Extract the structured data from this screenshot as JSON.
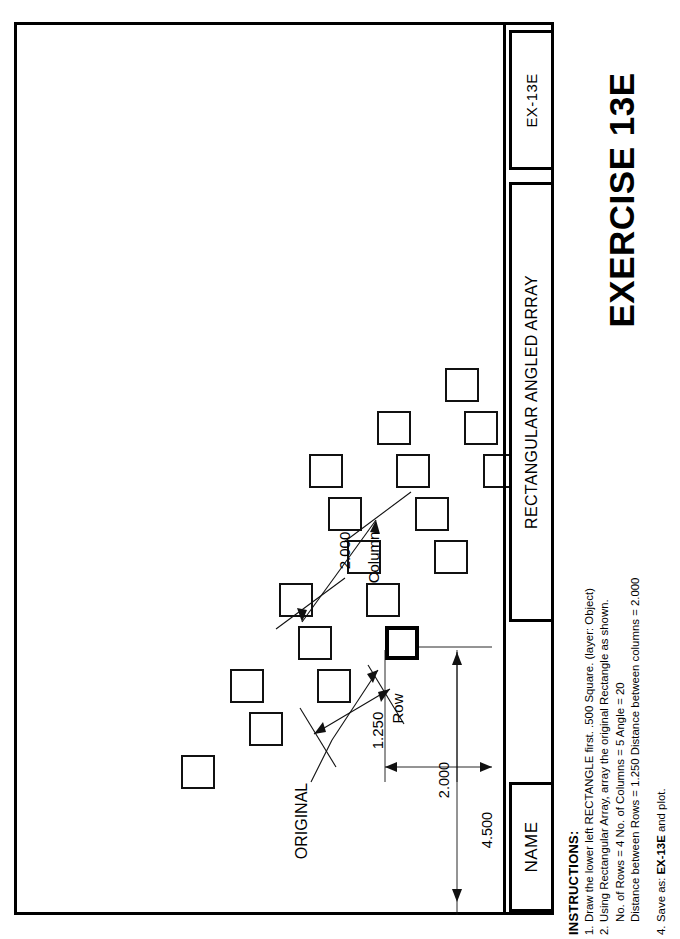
{
  "sheet": {
    "headline": "EXERCISE 13E",
    "title_block": {
      "drawing_number": "EX-13E",
      "drawing_title": "RECTANGULAR ANGLED ARRAY",
      "name_label": "NAME"
    }
  },
  "instructions": {
    "heading": "INSTRUCTIONS:",
    "items": [
      {
        "num": "1.",
        "text": "Draw the lower left RECTANGLE first.  .500 Square. (layer: Object)"
      },
      {
        "num": "2.",
        "text": "Using Rectangular Array, array the original Rectangle as shown."
      },
      {
        "num": "",
        "text": "No. of Rows = 4     No. of Columns = 5   Angle = 20"
      },
      {
        "num": "",
        "text": "Distance between Rows = 1.250   Distance between columns = 2.000"
      },
      {
        "num": "4.",
        "text": "Save as:  EX-13E and plot.",
        "bold_token": "EX-13E"
      }
    ],
    "save_as_prefix": "Save as:  ",
    "save_as_file": "EX-13E",
    "save_as_suffix": " and plot."
  },
  "drawing": {
    "original_label": "ORIGINAL",
    "dimensions": [
      {
        "name": "column-spacing",
        "value": "2.000",
        "label": "Column"
      },
      {
        "name": "row-spacing",
        "value": "1.250",
        "label": "Row"
      },
      {
        "name": "offset-2000",
        "value": "2.000",
        "label": ""
      },
      {
        "name": "overall-4500",
        "value": "4.500",
        "label": ""
      }
    ],
    "array": {
      "rows": 4,
      "columns": 5,
      "angle_degrees": 20,
      "square_size": ".500",
      "squares": [
        {
          "x": 371,
          "y": 604,
          "original": true
        },
        {
          "x": 303,
          "y": 647,
          "original": false
        },
        {
          "x": 235,
          "y": 690,
          "original": false
        },
        {
          "x": 167,
          "y": 733,
          "original": false
        },
        {
          "x": 420,
          "y": 518,
          "original": false
        },
        {
          "x": 352,
          "y": 561,
          "original": false
        },
        {
          "x": 284,
          "y": 604,
          "original": false
        },
        {
          "x": 216,
          "y": 647,
          "original": false
        },
        {
          "x": 469,
          "y": 432,
          "original": false
        },
        {
          "x": 401,
          "y": 475,
          "original": false
        },
        {
          "x": 333,
          "y": 518,
          "original": false
        },
        {
          "x": 265,
          "y": 561,
          "original": false
        },
        {
          "x": 450,
          "y": 389,
          "original": false
        },
        {
          "x": 382,
          "y": 432,
          "original": false
        },
        {
          "x": 314,
          "y": 475,
          "original": false
        },
        {
          "x": 499,
          "y": 303,
          "original": false
        },
        {
          "x": 431,
          "y": 346,
          "original": false
        },
        {
          "x": 363,
          "y": 389,
          "original": false
        },
        {
          "x": 295,
          "y": 432,
          "original": false
        }
      ]
    }
  },
  "colors": {
    "ink": "#000000",
    "paper": "#ffffff",
    "line": "#111111"
  }
}
